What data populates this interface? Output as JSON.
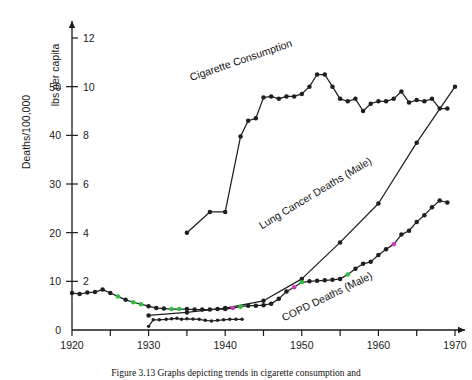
{
  "figure": {
    "caption": "Figure 3.13   Graphs depicting trends in cigarette consumption and",
    "background": "#ffffff",
    "line_color": "#1f1f1f",
    "artifact_green": "#2fbf3f",
    "artifact_magenta": "#c83fb0"
  },
  "chart_data": {
    "type": "line",
    "title": "",
    "xlabel": "",
    "ylabel": "Deaths/100,000",
    "y2label": "lbs per capita",
    "xlim": [
      1920,
      1970
    ],
    "ylim": [
      0,
      60
    ],
    "y2lim": [
      0,
      12
    ],
    "grid": false,
    "legend": "inline-labels",
    "xticks": [
      1920,
      1925,
      1930,
      1935,
      1940,
      1945,
      1950,
      1955,
      1960,
      1965,
      1970
    ],
    "xticklabels": [
      "1920",
      "",
      "1930",
      "",
      "1940",
      "",
      "1950",
      "",
      "1960",
      "",
      "1970"
    ],
    "yticks": [
      0,
      10,
      20,
      30,
      40,
      50
    ],
    "yticklabels": [
      "0",
      "10",
      "20",
      "30",
      "40",
      "50"
    ],
    "y2ticks": [
      2,
      4,
      6,
      8,
      10,
      12
    ],
    "y2ticklabels": [
      "2",
      "4",
      "6",
      "8",
      "10",
      "12"
    ],
    "series": [
      {
        "name": "Cigarette Consumption",
        "label": "Cigarette Consumption",
        "axis": "right",
        "units": "lbs per capita",
        "label_x": 1942.2,
        "label_y": 10.95,
        "label_rotation": -19,
        "x": [
          1935,
          1938,
          1940,
          1942,
          1943,
          1944,
          1945,
          1946,
          1947,
          1948,
          1949,
          1950,
          1951,
          1952,
          1953,
          1954,
          1955,
          1956,
          1957,
          1958,
          1959,
          1960,
          1961,
          1962,
          1963,
          1964,
          1965,
          1966,
          1967,
          1968,
          1969
        ],
        "y": [
          4.0,
          4.85,
          4.85,
          7.95,
          8.6,
          8.7,
          9.55,
          9.6,
          9.5,
          9.6,
          9.6,
          9.7,
          10.0,
          10.5,
          10.5,
          10.0,
          9.5,
          9.4,
          9.5,
          9.0,
          9.3,
          9.4,
          9.4,
          9.5,
          9.8,
          9.35,
          9.45,
          9.4,
          9.5,
          9.1,
          9.1
        ]
      },
      {
        "name": "Lung Cancer Deaths (Male)",
        "label": "Lung Cancer Deaths (Male)",
        "axis": "left",
        "units": "Deaths/100,000",
        "label_x": 1952.0,
        "label_y": 27.5,
        "label_rotation": -31,
        "x": [
          1930,
          1935,
          1940,
          1945,
          1950,
          1955,
          1960,
          1965,
          1970
        ],
        "y": [
          3.0,
          3.6,
          4.5,
          6.0,
          10.5,
          18.0,
          26.0,
          38.5,
          50.0
        ]
      },
      {
        "name": "COPD Deaths (Male)",
        "label": "COPD Deaths (Male)",
        "axis": "left",
        "units": "Deaths/100,000",
        "label_x": 1953.5,
        "label_y": 6.2,
        "label_rotation": -26,
        "x": [
          1920,
          1921,
          1922,
          1923,
          1924,
          1925,
          1926,
          1927,
          1928,
          1929,
          1930,
          1931,
          1932,
          1933,
          1934,
          1935,
          1936,
          1937,
          1938,
          1939,
          1940,
          1941,
          1942,
          1943,
          1944,
          1945,
          1946,
          1947,
          1948,
          1949,
          1950,
          1951,
          1952,
          1953,
          1954,
          1955,
          1956,
          1957,
          1958,
          1959,
          1960,
          1961,
          1962,
          1963,
          1964,
          1965,
          1966,
          1967,
          1968,
          1969
        ],
        "y": [
          7.6,
          7.4,
          7.7,
          7.8,
          8.3,
          7.6,
          6.9,
          6.2,
          5.7,
          5.3,
          4.9,
          4.5,
          4.4,
          4.3,
          4.3,
          4.3,
          4.2,
          4.2,
          4.2,
          4.3,
          4.3,
          4.5,
          4.8,
          5.0,
          5.0,
          5.1,
          5.4,
          6.4,
          7.9,
          8.8,
          9.8,
          10.0,
          10.1,
          10.2,
          10.3,
          10.5,
          11.4,
          12.6,
          13.6,
          14.0,
          15.4,
          16.6,
          17.6,
          19.6,
          20.4,
          22.2,
          23.6,
          25.2,
          26.6,
          26.2
        ]
      },
      {
        "name": "Lower baseline trace",
        "label": "",
        "axis": "left",
        "units": "Deaths/100,000",
        "x": [
          1930,
          1930.6,
          1931.4,
          1932.3,
          1933.0,
          1933.7,
          1934.3,
          1935.0,
          1935.8,
          1936.6,
          1937.4,
          1938.2,
          1939.0,
          1939.8,
          1940.6,
          1941.4,
          1942.2
        ],
        "y": [
          0.75,
          2.1,
          2.1,
          2.2,
          2.3,
          2.4,
          2.2,
          2.3,
          2.25,
          2.2,
          2.0,
          1.85,
          2.0,
          2.1,
          2.2,
          2.2,
          2.2
        ]
      }
    ],
    "marker_artifacts": {
      "green_points": [
        {
          "series": "COPD Deaths (Male)",
          "x": 1926
        },
        {
          "series": "COPD Deaths (Male)",
          "x": 1928
        },
        {
          "series": "COPD Deaths (Male)",
          "x": 1929
        },
        {
          "series": "COPD Deaths (Male)",
          "x": 1933
        },
        {
          "series": "COPD Deaths (Male)",
          "x": 1934
        },
        {
          "series": "COPD Deaths (Male)",
          "x": 1942
        },
        {
          "series": "COPD Deaths (Male)",
          "x": 1950
        },
        {
          "series": "COPD Deaths (Male)",
          "x": 1956
        }
      ],
      "magenta_points": [
        {
          "series": "COPD Deaths (Male)",
          "x": 1941
        },
        {
          "series": "COPD Deaths (Male)",
          "x": 1949
        },
        {
          "series": "COPD Deaths (Male)",
          "x": 1962
        }
      ]
    }
  }
}
